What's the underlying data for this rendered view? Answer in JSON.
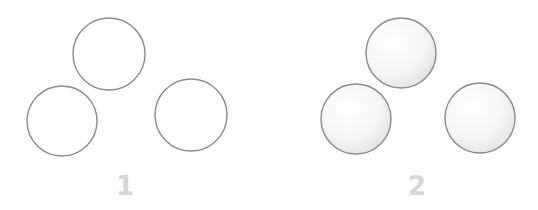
{
  "panels": [
    {
      "label": "1",
      "style": "outline",
      "label_pos": {
        "x": 125,
        "y": 173
      },
      "circles": [
        {
          "name": "top",
          "cx": 109,
          "cy": 54,
          "r": 36
        },
        {
          "name": "left",
          "cx": 62,
          "cy": 121,
          "r": 35
        },
        {
          "name": "right",
          "cx": 191,
          "cy": 115,
          "r": 36
        }
      ]
    },
    {
      "label": "2",
      "style": "shaded",
      "label_pos": {
        "x": 417,
        "y": 173
      },
      "circles": [
        {
          "name": "top",
          "cx": 401,
          "cy": 53,
          "r": 35
        },
        {
          "name": "left",
          "cx": 356,
          "cy": 119,
          "r": 35
        },
        {
          "name": "right",
          "cx": 480,
          "cy": 118,
          "r": 35
        }
      ]
    }
  ],
  "colors": {
    "stroke": "#8a8a8a",
    "label": "#d6d6d6",
    "shade": "#e6e6e6"
  }
}
